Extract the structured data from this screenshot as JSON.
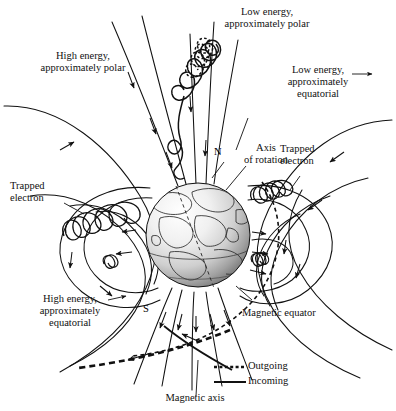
{
  "figure": {
    "kind": "earth-magnetosphere-radiation-belt-diagram",
    "background": "#ffffff",
    "ink": "#111111"
  },
  "labels": {
    "low_energy_polar": {
      "line1": "Low energy,",
      "line2": "approximately polar"
    },
    "high_energy_polar": {
      "line1": "High energy,",
      "line2": "approximately polar"
    },
    "low_energy_equatorial": {
      "line1": "Low energy,",
      "line2": "approximately",
      "line3": "equatorial"
    },
    "high_energy_equatorial": {
      "line1": "High energy,",
      "line2": "approximately",
      "line3": "equatorial"
    },
    "trapped_electron_left": {
      "line1": "Trapped",
      "line2": "electron"
    },
    "trapped_electron_right": {
      "line1": "Trapped",
      "line2": "electron"
    },
    "axis_of_rotation": {
      "line1": "Axis",
      "line2": "of rotation"
    },
    "magnetic_equator": "Magnetic equator",
    "magnetic_axis": "Magnetic axis",
    "north_pole": "N",
    "south_pole": "S"
  },
  "legend": {
    "items": [
      {
        "name": "outgoing",
        "label": "Outgoing",
        "style": "dotted"
      },
      {
        "name": "incoming",
        "label": "Incoming",
        "style": "solid"
      }
    ]
  },
  "globe": {
    "center_x": 198,
    "center_y": 235,
    "radius": 52,
    "highlight": "#f2f2f2",
    "shadow": "#8d8d8d"
  },
  "colors": {
    "ink": "#111111",
    "globe_light": "#fbfbfb",
    "globe_mid": "#d9d9d9",
    "globe_dark": "#8a8a8a"
  }
}
